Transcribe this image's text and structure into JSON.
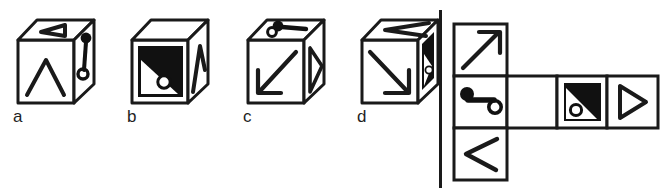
{
  "figure": {
    "kind": "cube-folding-spatial-reasoning-item",
    "answer_options": [
      {
        "label": "a",
        "faces": {
          "top": "triangle-pointing-left-outline",
          "front": "caret-up-chevron",
          "right": "key-symbol"
        }
      },
      {
        "label": "b",
        "faces": {
          "top": "blank",
          "front": "black-square-with-white-triangle-and-circle",
          "right": "caret-up-chevron"
        }
      },
      {
        "label": "c",
        "faces": {
          "top": "key-symbol",
          "front": "arrow-pointing-down-left",
          "right": "triangle-pointing-right-outline"
        }
      },
      {
        "label": "d",
        "faces": {
          "top": "chevron-pointing-left",
          "front": "arrow-pointing-down-right",
          "right": "black-square-with-white-triangle-and-circle"
        }
      }
    ],
    "divider": {
      "orientation": "vertical",
      "color": "#1a1a1a"
    },
    "net": {
      "description": "unfolded cube net, T-shaped: three stacked squares in left column plus three squares extending right from the middle row",
      "grid_columns": 4,
      "grid_rows": 3,
      "cells": [
        {
          "row": 0,
          "col": 0,
          "symbol": "arrow-pointing-up-right"
        },
        {
          "row": 1,
          "col": 0,
          "symbol": "key-symbol"
        },
        {
          "row": 1,
          "col": 1,
          "symbol": "blank"
        },
        {
          "row": 1,
          "col": 2,
          "symbol": "black-square-with-white-triangle-and-circle"
        },
        {
          "row": 1,
          "col": 3,
          "symbol": "triangle-pointing-right-outline"
        },
        {
          "row": 2,
          "col": 0,
          "symbol": "chevron-pointing-left"
        }
      ]
    },
    "colors": {
      "ink": "#1a1a1a",
      "fill_black": "#111111",
      "paper": "#ffffff"
    }
  }
}
